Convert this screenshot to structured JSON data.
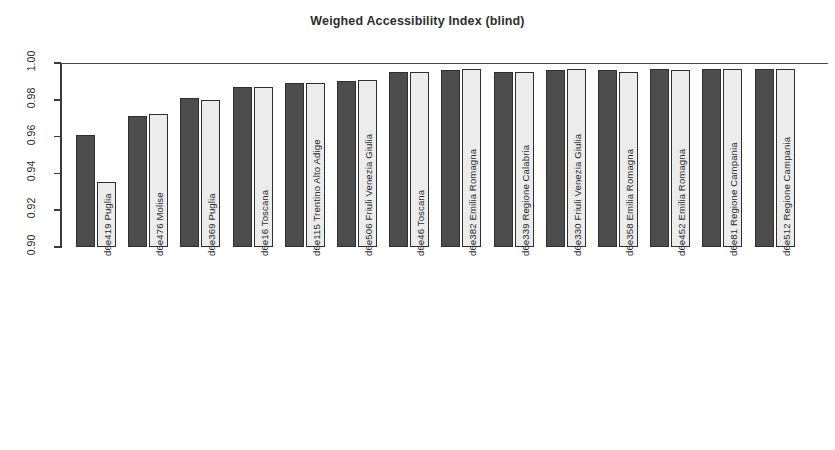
{
  "chart_data": {
    "type": "bar",
    "title": "Weighed Accessibility Index (blind)",
    "xlabel": "",
    "ylabel": "",
    "ylim": [
      0.9,
      1.0
    ],
    "yticks": [
      "0.90",
      "0.92",
      "0.94",
      "0.96",
      "0.98",
      "1.00"
    ],
    "ytick_values": [
      0.9,
      0.92,
      0.94,
      0.96,
      0.98,
      1.0
    ],
    "grid": false,
    "legend": "none",
    "reference_line": 1.0,
    "colors": {
      "series_a": "#4d4d4d",
      "series_b": "#ececec",
      "outline": "#2f2f2f",
      "axis": "#3a3a3a",
      "text": "#2b2b2b"
    },
    "categories": [
      "d6e419 Puglia",
      "d6e476 Molise",
      "d6e369 Puglia",
      "d6e16 Toscana",
      "d6e115 Trentino Alto Adige",
      "d6e506 Friuli Venezia Giulia",
      "d6e46 Toscana",
      "d6e382 Emilia Romagna",
      "d6e339 Regione Calabria",
      "d6e330 Friuli Venezia Giulia",
      "d6e358 Emilia Romagna",
      "d6e452 Emilia Romagna",
      "d6e81 Regione Campania",
      "d6e512 Regione Campania"
    ],
    "series": [
      {
        "name": "series_a",
        "values": [
          0.961,
          0.971,
          0.981,
          0.987,
          0.989,
          0.99,
          0.995,
          0.996,
          0.995,
          0.996,
          0.996,
          0.997,
          0.997,
          0.997
        ]
      },
      {
        "name": "series_b",
        "values": [
          0.9355,
          0.9725,
          0.98,
          0.987,
          0.989,
          0.991,
          0.995,
          0.997,
          0.995,
          0.997,
          0.995,
          0.996,
          0.997,
          0.997
        ]
      }
    ]
  }
}
